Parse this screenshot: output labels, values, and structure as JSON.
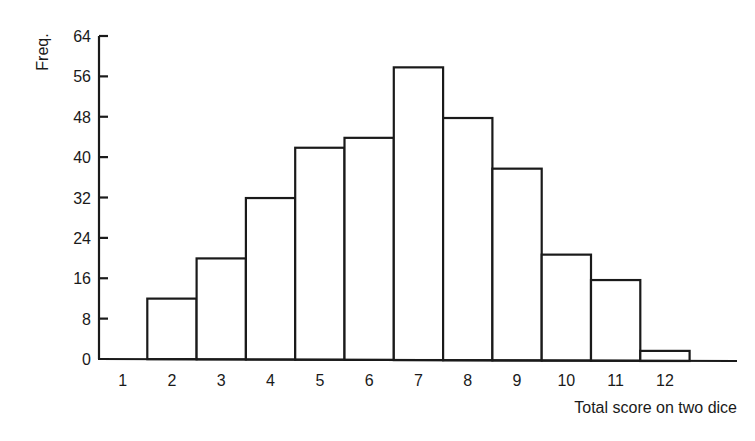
{
  "chart_data": {
    "type": "bar",
    "subtype": "histogram",
    "title": "",
    "xlabel": "Total score on two dice",
    "ylabel": "Freq.",
    "categories": [
      "1",
      "2",
      "3",
      "4",
      "5",
      "6",
      "7",
      "8",
      "9",
      "10",
      "11",
      "12"
    ],
    "values": [
      0,
      12,
      20,
      32,
      42,
      44,
      58,
      48,
      38,
      21,
      16,
      2
    ],
    "ylim": [
      0,
      64
    ],
    "yticks": [
      0,
      8,
      16,
      24,
      32,
      40,
      48,
      56,
      64
    ],
    "ytick_labels": [
      "0",
      "8",
      "16",
      "24",
      "32",
      "40",
      "48",
      "56",
      "64"
    ],
    "grid": false,
    "legend": null,
    "colors": {
      "bar_fill": "#ffffff",
      "bar_stroke": "#1a1a1a",
      "axis": "#1a1a1a"
    }
  }
}
